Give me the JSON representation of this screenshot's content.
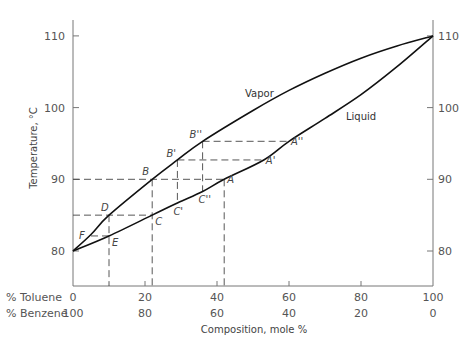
{
  "chart_data": {
    "type": "line",
    "title": "",
    "ylabel": "Temperature, °C",
    "xlabel": "Composition, mole %",
    "ylim": [
      75,
      112
    ],
    "xlim": [
      0,
      100
    ],
    "grid": false,
    "legend": "none (curves labelled inline)",
    "y_ticks": [
      80,
      90,
      100,
      110
    ],
    "y_ticks_right": [
      80,
      90,
      100,
      110
    ],
    "x_axis_rows": [
      {
        "label": "% Toluene",
        "ticks": [
          "0",
          "20",
          "40",
          "60",
          "80",
          "100"
        ]
      },
      {
        "label": "% Benzene",
        "ticks": [
          "100",
          "80",
          "60",
          "40",
          "20",
          "0"
        ]
      }
    ],
    "series": [
      {
        "name": "Vapor",
        "x": [
          0,
          5,
          10,
          22,
          29,
          36,
          50,
          60,
          70,
          80,
          90,
          100
        ],
        "y": [
          80,
          82.3,
          85,
          90,
          92.7,
          95.3,
          99.6,
          102.4,
          104.8,
          106.9,
          108.6,
          110
        ]
      },
      {
        "name": "Liquid",
        "x": [
          0,
          10,
          22,
          29,
          36,
          42,
          53,
          60,
          70,
          80,
          90,
          100
        ],
        "y": [
          80,
          82.1,
          85,
          86.7,
          88.3,
          90,
          92.7,
          95.3,
          98.5,
          101.8,
          105.7,
          110
        ]
      }
    ],
    "annotations": [
      {
        "label": "A",
        "x": 42,
        "y": 90
      },
      {
        "label": "A'",
        "x": 53,
        "y": 92.7
      },
      {
        "label": "A''",
        "x": 60,
        "y": 95.3
      },
      {
        "label": "B",
        "x": 22,
        "y": 90
      },
      {
        "label": "B'",
        "x": 29,
        "y": 92.7
      },
      {
        "label": "B''",
        "x": 36,
        "y": 95.3
      },
      {
        "label": "C",
        "x": 22,
        "y": 85
      },
      {
        "label": "C'",
        "x": 29,
        "y": 86.7
      },
      {
        "label": "C''",
        "x": 36,
        "y": 88.3
      },
      {
        "label": "D",
        "x": 10,
        "y": 85
      },
      {
        "label": "E",
        "x": 10,
        "y": 82.1
      },
      {
        "label": "F",
        "x": 5,
        "y": 82.1
      }
    ]
  },
  "labels": {
    "ylabel": "Temperature, °C",
    "xlabel": "Composition, mole %",
    "vapor": "Vapor",
    "liquid": "Liquid",
    "row1": "% Toluene",
    "row2": "% Benzene"
  }
}
